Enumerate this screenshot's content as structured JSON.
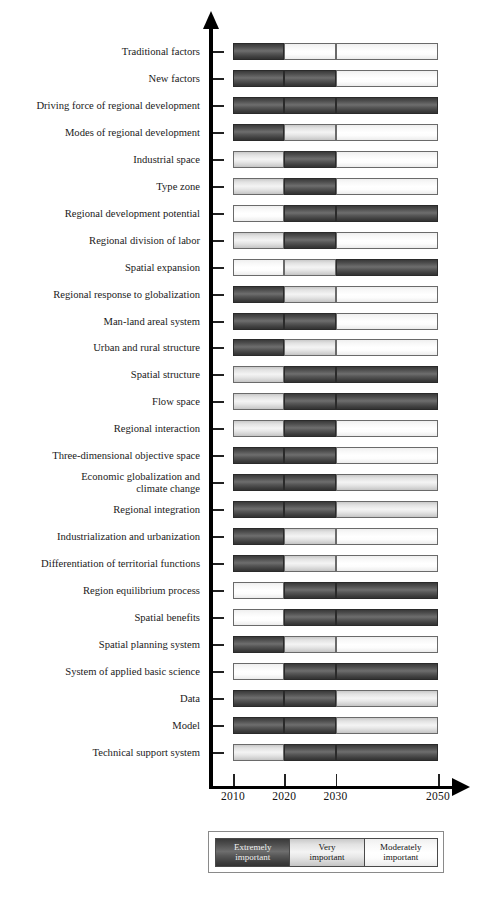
{
  "chart_data": {
    "type": "bar",
    "orientation": "horizontal-stacked-timeline",
    "title": "",
    "xlabel": "",
    "ylabel": "",
    "xlim": [
      2010,
      2050
    ],
    "x_ticks": [
      2010,
      2020,
      2030,
      2050
    ],
    "x_tick_labels": [
      "2010",
      "2020",
      "2030",
      "2050"
    ],
    "grid": false,
    "legend_position": "bottom",
    "legend": [
      {
        "key": "extreme",
        "label": "Extremely\nimportant",
        "color": "#4c4c4c"
      },
      {
        "key": "very",
        "label": "Very\nimportant",
        "color": "#e8e8e8"
      },
      {
        "key": "moderate",
        "label": "Moderately\nimportant",
        "color": "#ffffff"
      }
    ],
    "period_breaks": [
      2010,
      2020,
      2030,
      2050
    ],
    "periods": [
      "2010-2020",
      "2020-2030",
      "2030-2050"
    ],
    "categories": [
      "Traditional factors",
      "New factors",
      "Driving force of regional development",
      "Modes of regional development",
      "Industrial space",
      "Type zone",
      "Regional development potential",
      "Regional division of labor",
      "Spatial expansion",
      "Regional response to globalization",
      "Man-land areal system",
      "Urban and rural structure",
      "Spatial structure",
      "Flow space",
      "Regional interaction",
      "Three-dimensional objective space",
      "Economic globalization and\nclimate change",
      "Regional integration",
      "Industrialization and urbanization",
      "Differentiation of territorial functions",
      "Region equilibrium process",
      "Spatial benefits",
      "Spatial planning system",
      "System of applied basic science",
      "Data",
      "Model",
      "Technical support system"
    ],
    "values": [
      [
        "extreme",
        "moderate",
        "moderate"
      ],
      [
        "extreme",
        "extreme",
        "moderate"
      ],
      [
        "extreme",
        "extreme",
        "extreme"
      ],
      [
        "extreme",
        "very",
        "moderate"
      ],
      [
        "very",
        "extreme",
        "moderate"
      ],
      [
        "very",
        "extreme",
        "moderate"
      ],
      [
        "moderate",
        "extreme",
        "extreme"
      ],
      [
        "very",
        "extreme",
        "moderate"
      ],
      [
        "moderate",
        "very",
        "extreme"
      ],
      [
        "extreme",
        "very",
        "moderate"
      ],
      [
        "extreme",
        "extreme",
        "moderate"
      ],
      [
        "extreme",
        "very",
        "moderate"
      ],
      [
        "very",
        "extreme",
        "extreme"
      ],
      [
        "very",
        "extreme",
        "extreme"
      ],
      [
        "very",
        "extreme",
        "moderate"
      ],
      [
        "extreme",
        "extreme",
        "moderate"
      ],
      [
        "extreme",
        "extreme",
        "very"
      ],
      [
        "extreme",
        "extreme",
        "very"
      ],
      [
        "extreme",
        "very",
        "moderate"
      ],
      [
        "extreme",
        "very",
        "moderate"
      ],
      [
        "moderate",
        "extreme",
        "extreme"
      ],
      [
        "moderate",
        "extreme",
        "extreme"
      ],
      [
        "extreme",
        "very",
        "moderate"
      ],
      [
        "moderate",
        "extreme",
        "extreme"
      ],
      [
        "extreme",
        "extreme",
        "very"
      ],
      [
        "extreme",
        "extreme",
        "very"
      ],
      [
        "very",
        "extreme",
        "extreme"
      ]
    ]
  }
}
